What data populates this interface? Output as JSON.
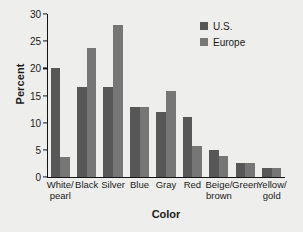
{
  "chart_data": {
    "type": "bar",
    "title": "",
    "xlabel": "Color",
    "ylabel": "Percent",
    "ylim": [
      0,
      30
    ],
    "yticks": [
      0,
      5,
      10,
      15,
      20,
      25,
      30
    ],
    "grid": false,
    "legend_position": "top-right",
    "categories": [
      "White/\npearl",
      "Black",
      "Silver",
      "Blue",
      "Gray",
      "Red",
      "Beige/\nbrown",
      "Green",
      "Yellow/\ngold"
    ],
    "series": [
      {
        "name": "U.S.",
        "color": "#575757",
        "values": [
          20.0,
          16.5,
          16.5,
          12.9,
          11.9,
          11.0,
          4.9,
          2.6,
          1.6
        ]
      },
      {
        "name": "Europe",
        "color": "#767676",
        "values": [
          3.6,
          23.7,
          28.0,
          12.9,
          15.9,
          5.8,
          3.9,
          2.6,
          1.6
        ]
      }
    ]
  },
  "legend": {
    "entries": [
      {
        "label": "U.S.",
        "color": "#575757"
      },
      {
        "label": "Europe",
        "color": "#767676"
      }
    ]
  },
  "colors": {
    "background": "#eeeeec",
    "axis": "#141414",
    "text": "#1a1a1a",
    "series_us": "#575757",
    "series_europe": "#767676"
  }
}
